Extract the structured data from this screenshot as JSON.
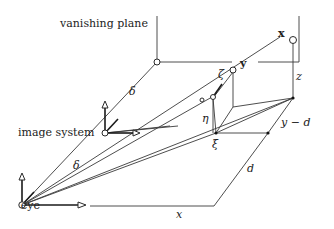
{
  "diagram": {
    "labels": {
      "vanishing_plane": "vanishing plane",
      "image_system": "image system",
      "eye": "eye",
      "x_point": "x",
      "y_point": "y",
      "delta_upper": "δ",
      "delta_lower": "δ",
      "zeta": "ζ",
      "eta": "η",
      "xi": "ξ",
      "z": "z",
      "y_minus_d": "y − d",
      "d": "d",
      "x_axis": "x"
    },
    "colors": {
      "line": "#3a3a3a",
      "background": "#ffffff"
    }
  }
}
